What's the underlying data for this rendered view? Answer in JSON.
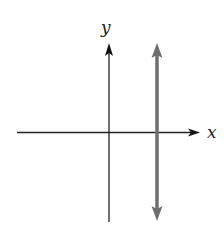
{
  "diagram": {
    "axes": {
      "x_label": "x",
      "y_label": "y",
      "color": "#222222"
    },
    "vertical_line": {
      "type": "double-arrow",
      "position": "right of y-axis",
      "color": "#6e6e6e"
    }
  }
}
